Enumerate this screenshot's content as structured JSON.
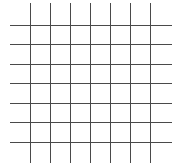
{
  "diagram": {
    "type": "grid",
    "background": "#ffffff",
    "line_color": "#4a4a4a",
    "line_width": 1,
    "vertical_lines": {
      "x": [
        30.5,
        50.5,
        70.5,
        90.5,
        110.5,
        130.5,
        150.5
      ],
      "y_start": 3,
      "y_end": 163
    },
    "horizontal_lines": {
      "y": [
        25.5,
        44.5,
        64.5,
        83.5,
        103.5,
        122.5,
        142.5
      ],
      "x_start": 10,
      "x_end": 172
    }
  }
}
